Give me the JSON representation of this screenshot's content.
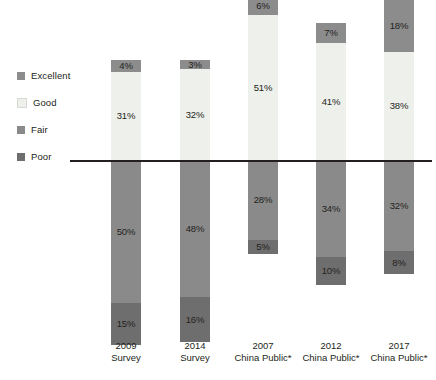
{
  "chart_data": {
    "type": "bar",
    "subtype": "diverging-stacked-bar",
    "title": "",
    "subtitle": "",
    "xlabel": "",
    "ylabel": "",
    "grid": false,
    "legend_position": "left",
    "value_suffix": "%",
    "baseline_value": 0,
    "categories": [
      "2009 Survey",
      "2014 Survey",
      "2007 China Public*",
      "2012 China Public*",
      "2017 China Public*"
    ],
    "category_lines": [
      [
        "2009",
        "Survey"
      ],
      [
        "2014",
        "Survey"
      ],
      [
        "2007",
        "China Public*"
      ],
      [
        "2012",
        "China Public*"
      ],
      [
        "2017",
        "China Public*"
      ]
    ],
    "series": [
      {
        "name": "Excellent",
        "color": "#8c8c8c",
        "direction": "up",
        "values": [
          4,
          3,
          6,
          7,
          18
        ]
      },
      {
        "name": "Good",
        "color": "#eef0ec",
        "direction": "up",
        "values": [
          31,
          32,
          51,
          41,
          38
        ]
      },
      {
        "name": "Fair",
        "color": "#8a8a8a",
        "direction": "down",
        "values": [
          50,
          48,
          28,
          34,
          32
        ]
      },
      {
        "name": "Poor",
        "color": "#6e6e6e",
        "direction": "down",
        "values": [
          15,
          16,
          5,
          10,
          8
        ]
      }
    ],
    "bars": [
      {
        "category": "2009 Survey",
        "above": [
          {
            "series": "Good",
            "value": 31,
            "label": "31%",
            "label_color": "dark"
          },
          {
            "series": "Excellent",
            "value": 4,
            "label": "4%",
            "label_color": "dark"
          }
        ],
        "below": [
          {
            "series": "Fair",
            "value": 50,
            "label": "50%",
            "label_color": "dark"
          },
          {
            "series": "Poor",
            "value": 15,
            "label": "15%",
            "label_color": "dark"
          }
        ]
      },
      {
        "category": "2014 Survey",
        "above": [
          {
            "series": "Good",
            "value": 32,
            "label": "32%",
            "label_color": "dark"
          },
          {
            "series": "Excellent",
            "value": 3,
            "label": "3%",
            "label_color": "dark"
          }
        ],
        "below": [
          {
            "series": "Fair",
            "value": 48,
            "label": "48%",
            "label_color": "dark"
          },
          {
            "series": "Poor",
            "value": 16,
            "label": "16%",
            "label_color": "dark"
          }
        ]
      },
      {
        "category": "2007 China Public*",
        "above": [
          {
            "series": "Good",
            "value": 51,
            "label": "51%",
            "label_color": "dark"
          },
          {
            "series": "Excellent",
            "value": 6,
            "label": "6%",
            "label_color": "dark"
          }
        ],
        "below": [
          {
            "series": "Fair",
            "value": 28,
            "label": "28%",
            "label_color": "dark"
          },
          {
            "series": "Poor",
            "value": 5,
            "label": "5%",
            "label_color": "dark"
          }
        ]
      },
      {
        "category": "2012 China Public*",
        "above": [
          {
            "series": "Good",
            "value": 41,
            "label": "41%",
            "label_color": "dark"
          },
          {
            "series": "Excellent",
            "value": 7,
            "label": "7%",
            "label_color": "dark"
          }
        ],
        "below": [
          {
            "series": "Fair",
            "value": 34,
            "label": "34%",
            "label_color": "dark"
          },
          {
            "series": "Poor",
            "value": 10,
            "label": "10%",
            "label_color": "dark"
          }
        ]
      },
      {
        "category": "2017 China Public*",
        "above": [
          {
            "series": "Good",
            "value": 38,
            "label": "38%",
            "label_color": "dark"
          },
          {
            "series": "Excellent",
            "value": 18,
            "label": "18%",
            "label_color": "dark"
          }
        ],
        "below": [
          {
            "series": "Fair",
            "value": 32,
            "label": "32%",
            "label_color": "dark"
          },
          {
            "series": "Poor",
            "value": 8,
            "label": "8%",
            "label_color": "dark"
          }
        ]
      }
    ]
  },
  "legend": {
    "items": [
      {
        "label": "Excellent",
        "color": "#8c8c8c"
      },
      {
        "label": "Good",
        "color": "#eef0ec"
      },
      {
        "label": "Fair",
        "color": "#8a8a8a"
      },
      {
        "label": "Poor",
        "color": "#6e6e6e"
      }
    ]
  },
  "colors": {
    "excellent": "#8c8c8c",
    "good": "#eef0ec",
    "fair": "#8a8a8a",
    "poor": "#6e6e6e",
    "axis": "#231f20",
    "text": "#231f20",
    "background": "#ffffff"
  },
  "axis": {
    "baseline_left": 70,
    "baseline_top": 160,
    "baseline_width": 362,
    "px_per_percent": 2.85
  }
}
